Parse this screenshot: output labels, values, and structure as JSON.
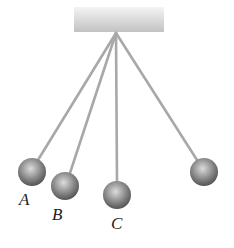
{
  "diagram": {
    "type": "pendulums",
    "support": {
      "x": 74,
      "y": 7,
      "width": 90,
      "height": 25
    },
    "pivot": {
      "x": 116,
      "y": 33
    },
    "pendulums": [
      {
        "id": "A",
        "label": "A",
        "ball": {
          "cx": 32,
          "cy": 172,
          "r": 14
        },
        "label_pos": {
          "x": 19,
          "y": 191
        }
      },
      {
        "id": "B",
        "label": "B",
        "ball": {
          "cx": 65,
          "cy": 186,
          "r": 14
        },
        "label_pos": {
          "x": 52,
          "y": 206
        }
      },
      {
        "id": "C",
        "label": "C",
        "ball": {
          "cx": 117,
          "cy": 195,
          "r": 14
        },
        "label_pos": {
          "x": 111,
          "y": 215
        }
      },
      {
        "id": "D",
        "label": "",
        "ball": {
          "cx": 204,
          "cy": 172,
          "r": 14
        },
        "label_pos": null
      }
    ],
    "colors": {
      "string": "#a8a8a8",
      "ball_light": "#d0d0d0",
      "ball_dark": "#5a5a5a",
      "support_light": "#f2f2f2",
      "support_dark": "#c4c4c4"
    }
  }
}
